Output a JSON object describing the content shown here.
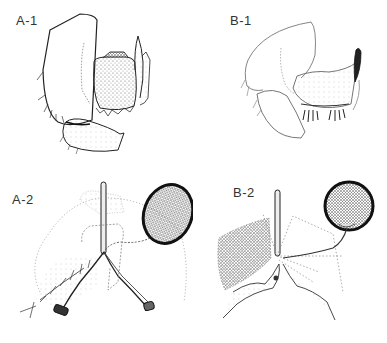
{
  "figure": {
    "panels": [
      {
        "id": "A-1",
        "label": "A-1",
        "description": "Male genitalia, lateral view (species A)"
      },
      {
        "id": "B-1",
        "label": "B-1",
        "description": "Male genitalia, lateral view (species B)"
      },
      {
        "id": "A-2",
        "label": "A-2",
        "description": "Female reproductive structures with spermatheca (species A)"
      },
      {
        "id": "B-2",
        "label": "B-2",
        "description": "Female reproductive structures with spermatheca (species B)"
      }
    ],
    "colors": {
      "background": "#ffffff",
      "ink": "#222222",
      "stipple": "#888888"
    }
  }
}
